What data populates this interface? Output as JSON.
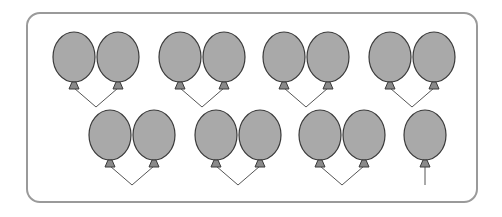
{
  "figure": {
    "colors": {
      "balloon_fill": "#a9a9a9",
      "balloon_stroke": "#3a3a3a",
      "string": "#555555",
      "frame": "#9a9a9a"
    },
    "rows": [
      {
        "y_top": 32,
        "groups": [
          {
            "count": 2,
            "centers": [
              74,
              118
            ]
          },
          {
            "count": 2,
            "centers": [
              180,
              224
            ]
          },
          {
            "count": 2,
            "centers": [
              284,
              328
            ]
          },
          {
            "count": 2,
            "centers": [
              390,
              434
            ]
          }
        ]
      },
      {
        "y_top": 110,
        "groups": [
          {
            "count": 2,
            "centers": [
              110,
              154
            ]
          },
          {
            "count": 2,
            "centers": [
              216,
              260
            ]
          },
          {
            "count": 2,
            "centers": [
              320,
              364
            ]
          },
          {
            "count": 1,
            "centers": [
              425
            ]
          }
        ]
      }
    ],
    "total_balloons": 15
  }
}
